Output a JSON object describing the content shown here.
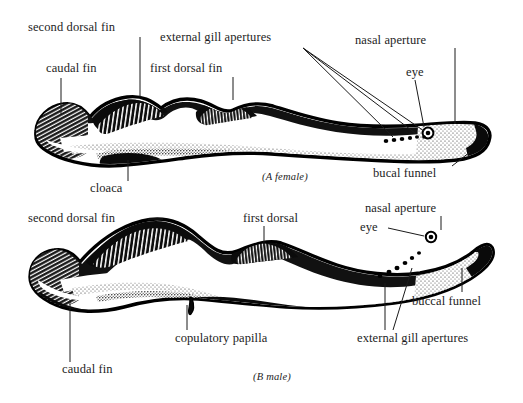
{
  "figure": {
    "type": "scientific-illustration",
    "background_color": "#ffffff",
    "ink_color": "#000000"
  },
  "panels": [
    {
      "id": "A",
      "caption": "(A female)",
      "labels": [
        {
          "key": "second_dorsal_fin",
          "text": "second dorsal fin"
        },
        {
          "key": "caudal_fin",
          "text": "caudal fin"
        },
        {
          "key": "first_dorsal_fin",
          "text": "first dorsal fin"
        },
        {
          "key": "external_gill",
          "text": "external gill apertures"
        },
        {
          "key": "nasal_aperture",
          "text": "nasal aperture"
        },
        {
          "key": "eye",
          "text": "eye"
        },
        {
          "key": "cloaca",
          "text": "cloaca"
        },
        {
          "key": "bucal_funnel",
          "text": "bucal funnel"
        }
      ]
    },
    {
      "id": "B",
      "caption": "(B male)",
      "labels": [
        {
          "key": "second_dorsal_fin",
          "text": "second dorsal fin"
        },
        {
          "key": "first_dorsal",
          "text": "first dorsal"
        },
        {
          "key": "nasal_aperture",
          "text": "nasal aperture"
        },
        {
          "key": "eye",
          "text": "eye"
        },
        {
          "key": "buccal_funnel",
          "text": "buccal funnel"
        },
        {
          "key": "external_gill",
          "text": "external gill apertures"
        },
        {
          "key": "copulatory_papilla",
          "text": "copulatory papilla"
        },
        {
          "key": "caudal_fin",
          "text": "caudal fin"
        }
      ]
    }
  ]
}
